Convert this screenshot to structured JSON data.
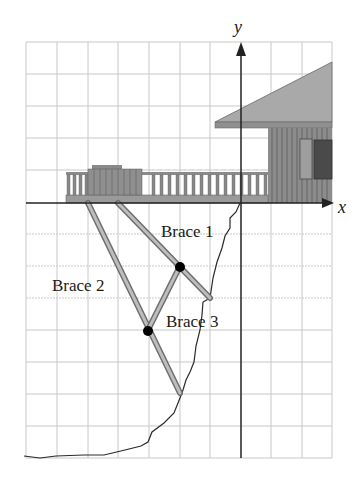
{
  "figure": {
    "type": "coordinate-grid-diagram"
  },
  "axes": {
    "x_label": "x",
    "y_label": "y"
  },
  "grid": {
    "columns": 10,
    "rows": 13,
    "origin_col": 7,
    "origin_row": 5
  },
  "labels": {
    "brace1": "Brace 1",
    "brace2": "Brace 2",
    "brace3": "Brace 3"
  },
  "braces": [
    {
      "name": "Brace 1",
      "from_grid": [
        -4,
        0
      ],
      "to_grid": [
        -1,
        -3
      ]
    },
    {
      "name": "Brace 2",
      "from_grid": [
        -5,
        0
      ],
      "to_grid": [
        -2,
        -6
      ]
    },
    {
      "name": "Brace 3",
      "from_grid": [
        -3,
        -4
      ],
      "to_grid": [
        -2,
        -2
      ]
    }
  ],
  "joints": [
    {
      "name": "brace1-brace3-joint",
      "grid": [
        -2,
        -2
      ]
    },
    {
      "name": "brace2-brace3-joint",
      "grid": [
        -3,
        -4
      ]
    }
  ],
  "colors": {
    "grid": "#c8c8c8",
    "axis": "#222222",
    "roof": "#a9a9a9",
    "wall": "#8c8c8c",
    "deck": "#9a9a9a",
    "brace_outer": "#6e6e6e",
    "brace_inner": "#bdbdbd",
    "joint": "#000000",
    "cliff": "#2a2a2a"
  }
}
